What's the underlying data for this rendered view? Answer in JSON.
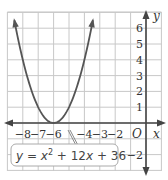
{
  "chart_data": {
    "type": "line",
    "title": "",
    "xlabel": "x",
    "ylabel": "y",
    "xlim": [
      -9,
      1
    ],
    "ylim": [
      -3,
      7
    ],
    "grid": true,
    "x_tick_labels": [
      "-8",
      "-7",
      "-6",
      "-4",
      "-3",
      "-2"
    ],
    "x_ticks": [
      -8,
      -7,
      -6,
      -4,
      -3,
      -2
    ],
    "y_tick_labels": [
      "6",
      "5",
      "4",
      "3",
      "2",
      "1",
      "-2"
    ],
    "y_ticks": [
      6,
      5,
      4,
      3,
      2,
      1,
      -2
    ],
    "origin_label": "O",
    "series": [
      {
        "name": "y = x^2 + 12x + 36",
        "function": "x^2 + 12x + 36",
        "x": [
          -8.6,
          -8,
          -7.5,
          -7,
          -6.5,
          -6,
          -5.5,
          -5,
          -4.5,
          -4,
          -3.4
        ],
        "values": [
          6.76,
          4,
          2.25,
          1,
          0.25,
          0,
          0.25,
          1,
          2.25,
          4,
          6.76
        ],
        "vertex": [
          -6,
          0
        ],
        "color": "#555555"
      }
    ],
    "annotations": [
      {
        "text": "y = x² + 12x + 36",
        "points_to": [
          -5.3,
          0.5
        ]
      }
    ]
  },
  "labels": {
    "y_axis": "y",
    "x_axis": "x",
    "origin": "O",
    "equation": {
      "y": "y",
      "eq": " = ",
      "x": "x",
      "sup": "2",
      "rest1": " + 12",
      "x2": "x",
      "rest2": " + 36"
    }
  },
  "colors": {
    "grid": "#c8c8c8",
    "axis": "#444444",
    "curve": "#555555",
    "label_box_border": "#aaaaaa"
  }
}
